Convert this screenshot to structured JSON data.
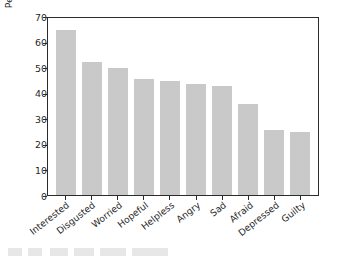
{
  "chart_data": {
    "type": "bar",
    "title": "",
    "subtitle": "",
    "xlabel": "",
    "ylabel": "Percent of respondents",
    "categories": [
      "Interested",
      "Disgusted",
      "Worried",
      "Hopeful",
      "Helpless",
      "Angry",
      "Sad",
      "Afraid",
      "Depressed",
      "Guilty"
    ],
    "values": [
      64.5,
      52,
      49.5,
      45.5,
      44.5,
      43.5,
      42.5,
      35.5,
      25.5,
      24.5
    ],
    "ylim": [
      0,
      70
    ],
    "yticks": [
      0,
      10,
      20,
      30,
      40,
      50,
      60,
      70
    ],
    "ytick_labels": [
      "0",
      "10",
      "20",
      "30",
      "40",
      "50",
      "60",
      "70"
    ],
    "grid": false,
    "legend": null,
    "bar_color": "#c9c9c9",
    "axis_color": "#2b2b2b",
    "annotations": []
  },
  "figure": {
    "background": "#ffffff"
  }
}
